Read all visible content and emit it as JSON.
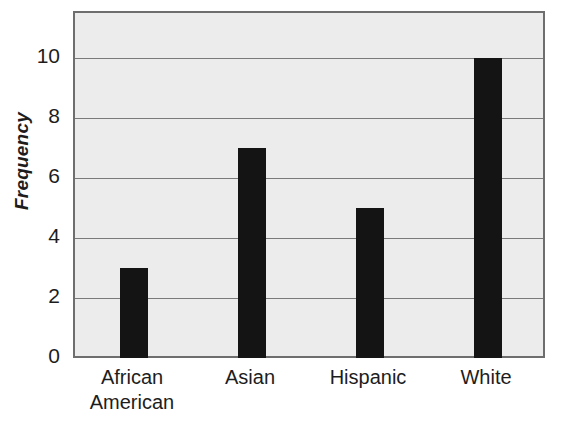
{
  "chart_data": {
    "type": "bar",
    "title": "",
    "xlabel": "",
    "ylabel": "Frequency",
    "categories": [
      "African American",
      "Asian",
      "Hispanic",
      "White"
    ],
    "category_lines": [
      [
        "African",
        "American"
      ],
      [
        "Asian"
      ],
      [
        "Hispanic"
      ],
      [
        "White"
      ]
    ],
    "values": [
      3,
      7,
      5,
      10
    ],
    "ylim": [
      0,
      11.5
    ],
    "yticks": [
      0,
      2,
      4,
      6,
      8,
      10
    ],
    "ytick_labels": [
      "0",
      "2",
      "4",
      "6",
      "8",
      "10"
    ],
    "grid": true,
    "grid_axis": "y",
    "legend": false,
    "orientation": "vertical",
    "bar_color": "#141414",
    "plot_background": "#ececec",
    "gridline_color": "#7a7a7a",
    "frame_color": "#6e6e6e"
  },
  "axes": {
    "y_title": "Frequency"
  },
  "ticks": {
    "y": [
      {
        "label": "10",
        "value": 10
      },
      {
        "label": "8",
        "value": 8
      },
      {
        "label": "6",
        "value": 6
      },
      {
        "label": "4",
        "value": 4
      },
      {
        "label": "2",
        "value": 2
      },
      {
        "label": "0",
        "value": 0
      }
    ],
    "x": [
      {
        "line1": "African",
        "line2": "American"
      },
      {
        "line1": "Asian",
        "line2": ""
      },
      {
        "line1": "Hispanic",
        "line2": ""
      },
      {
        "line1": "White",
        "line2": ""
      }
    ]
  },
  "bars": [
    {
      "category": "African American",
      "value": 3
    },
    {
      "category": "Asian",
      "value": 7
    },
    {
      "category": "Hispanic",
      "value": 5
    },
    {
      "category": "White",
      "value": 10
    }
  ]
}
